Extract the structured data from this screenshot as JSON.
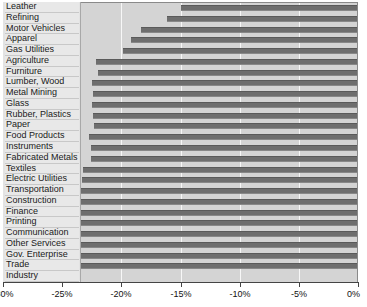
{
  "chart_data": {
    "type": "bar",
    "orientation": "horizontal",
    "title": "",
    "xlabel": "",
    "ylabel": "",
    "xlim": [
      -30,
      0
    ],
    "xticks": [
      -30,
      -25,
      -20,
      -15,
      -10,
      -5,
      0
    ],
    "xtick_labels": [
      "-30%",
      "-25%",
      "-20%",
      "-15%",
      "-10%",
      "-5%",
      "0%"
    ],
    "grid": true,
    "legend": "none",
    "categories": [
      "Leather",
      "Refining",
      "Motor Vehicles",
      "Apparel",
      "Gas Utilities",
      "Agriculture",
      "Furniture",
      "Lumber, Wood",
      "Metal Mining",
      "Glass",
      "Rubber, Plastics",
      "Paper",
      "Food Products",
      "Instruments",
      "Fabricated Metals",
      "Textiles",
      "Electric Utilities",
      "Transportation",
      "Construction",
      "Finance",
      "Printing",
      "Communication",
      "Other Services",
      "Gov. Enterprise",
      "Trade",
      "Industry"
    ],
    "values": [
      -15.0,
      -16.1,
      -18.3,
      -19.2,
      -19.9,
      -22.1,
      -22.0,
      -22.5,
      -22.4,
      -22.5,
      -22.4,
      -22.3,
      -22.7,
      -22.6,
      -22.6,
      -23.2,
      -23.3,
      -23.4,
      -24.3,
      -24.2,
      -24.5,
      -24.9,
      -25.1,
      -25.4,
      -24.9,
      null
    ],
    "colors": {
      "bar": "#6e6e6e",
      "plot_background": "#d4d4d4",
      "label_background": "#e8e8e8",
      "gridline": "#f7f7f7",
      "axis": "#444444"
    }
  }
}
